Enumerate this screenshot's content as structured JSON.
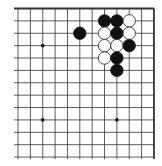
{
  "board": {
    "description": "Go board corner diagram (top-right corner)",
    "columns": 12,
    "rows": 13,
    "origin_x": 18,
    "origin_y": 8.5,
    "spacing_x": 12.36,
    "spacing_y": 12.38,
    "line_color": "#333333",
    "edge_top": true,
    "edge_right": true,
    "star_points": [
      [
        2,
        3
      ],
      [
        2,
        9
      ],
      [
        8,
        9
      ]
    ],
    "stone_radius": 6.2,
    "colors": {
      "black": "#111111",
      "white": "#ffffff",
      "white_outline": "#222222"
    },
    "stones": [
      {
        "col": 7,
        "row": 1,
        "color": "black"
      },
      {
        "col": 8,
        "row": 1,
        "color": "black"
      },
      {
        "col": 9,
        "row": 1,
        "color": "white"
      },
      {
        "col": 5,
        "row": 2,
        "color": "black"
      },
      {
        "col": 7,
        "row": 2,
        "color": "white"
      },
      {
        "col": 8,
        "row": 2,
        "color": "black"
      },
      {
        "col": 9,
        "row": 2,
        "color": "white"
      },
      {
        "col": 7,
        "row": 3,
        "color": "white"
      },
      {
        "col": 8,
        "row": 3,
        "color": "white"
      },
      {
        "col": 9,
        "row": 3,
        "color": "black"
      },
      {
        "col": 7,
        "row": 4,
        "color": "white"
      },
      {
        "col": 8,
        "row": 4,
        "color": "black"
      },
      {
        "col": 8,
        "row": 5,
        "color": "black"
      }
    ]
  }
}
